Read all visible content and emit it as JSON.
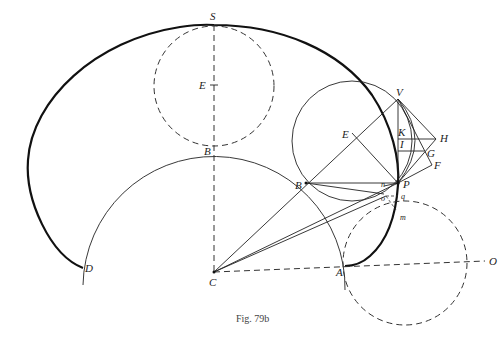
{
  "figure": {
    "caption": "Fig. 79b",
    "labels": {
      "S": "S",
      "E_top": "E",
      "B_top": "B",
      "E_rolling": "E",
      "B_contact": "B",
      "V": "V",
      "K": "K",
      "H": "H",
      "I": "I",
      "G": "G",
      "F": "F",
      "P": "P",
      "n": "n",
      "q": "q",
      "o": "o",
      "m": "m",
      "C": "C",
      "A": "A",
      "D": "D",
      "O": "O"
    },
    "colors": {
      "ink": "#111111",
      "background": "#ffffff"
    }
  }
}
